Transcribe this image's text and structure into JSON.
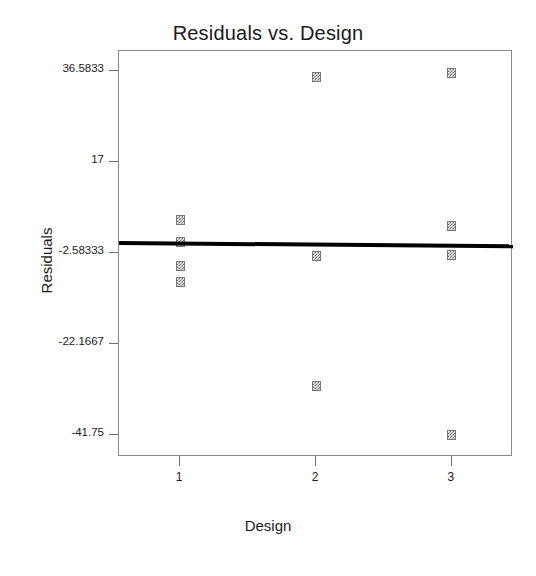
{
  "chart_data": {
    "type": "scatter",
    "title": "Residuals vs. Design",
    "xlabel": "Design",
    "ylabel": "Residuals",
    "grid": false,
    "legend": false,
    "xlim": [
      0.55,
      3.45
    ],
    "ylim": [
      -46.5,
      41.0
    ],
    "xticks": [
      1,
      2,
      3
    ],
    "xtick_labels": [
      "1",
      "2",
      "3"
    ],
    "yticks": [
      36.5833,
      17,
      -2.58333,
      -22.1667,
      -41.75
    ],
    "ytick_labels": [
      "36.5833",
      "17",
      "-2.58333",
      "-22.1667",
      "-41.75"
    ],
    "marker_style": "dithered-square",
    "marker_color": "#555555",
    "points": [
      {
        "x": 1,
        "y": 4.5
      },
      {
        "x": 1,
        "y": -0.1
      },
      {
        "x": 1,
        "y": -5.3
      },
      {
        "x": 1,
        "y": -8.8
      },
      {
        "x": 2,
        "y": 35.3
      },
      {
        "x": 2,
        "y": -3.2
      },
      {
        "x": 2,
        "y": -31.2
      },
      {
        "x": 3,
        "y": 36.2
      },
      {
        "x": 3,
        "y": 3.2
      },
      {
        "x": 3,
        "y": -2.9
      },
      {
        "x": 3,
        "y": -41.8
      }
    ],
    "fit_line": {
      "name": "regression-fit",
      "color": "#000000",
      "x_start": 0.55,
      "y_start": -0.3,
      "x_end": 3.45,
      "y_end": -1.0
    }
  }
}
